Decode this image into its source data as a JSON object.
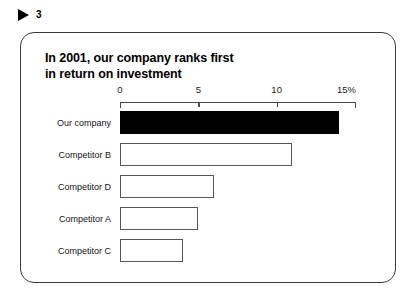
{
  "slide": {
    "marker_icon": "triangle-right-icon",
    "number": "3"
  },
  "chart_data": {
    "type": "bar",
    "orientation": "horizontal",
    "title": "In 2001, our company ranks first\nin return on investment",
    "categories": [
      "Our company",
      "Competitor B",
      "Competitor D",
      "Competitor A",
      "Competitor C"
    ],
    "values": [
      14,
      11,
      6,
      5,
      4
    ],
    "series": [
      {
        "name": "Return on investment",
        "values": [
          14,
          11,
          6,
          5,
          4
        ]
      }
    ],
    "highlight_index": 0,
    "highlight_color": "#000000",
    "bar_fill_color": "#ffffff",
    "bar_border_color": "#555555",
    "xlabel": "",
    "ylabel": "",
    "xlim": [
      0,
      15
    ],
    "xticks": [
      0,
      5,
      10,
      15
    ],
    "xticklabels": [
      "0",
      "5",
      "10",
      "15%"
    ],
    "unit": "%",
    "grid": false,
    "legend": "none",
    "axis_position": "top"
  }
}
